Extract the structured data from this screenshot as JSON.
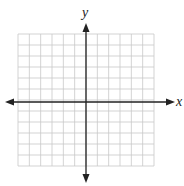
{
  "diagram": {
    "type": "coordinate-plane",
    "axes": {
      "x_label": "x",
      "y_label": "y",
      "arrows": "both-ends",
      "color": "#222222"
    },
    "grid": {
      "columns": 12,
      "rows": 12,
      "columns_left_of_y_axis": 6,
      "columns_right_of_y_axis": 6,
      "rows_above_x_axis": 6,
      "rows_below_x_axis": 6,
      "line_color": "#c8c8c8"
    }
  }
}
